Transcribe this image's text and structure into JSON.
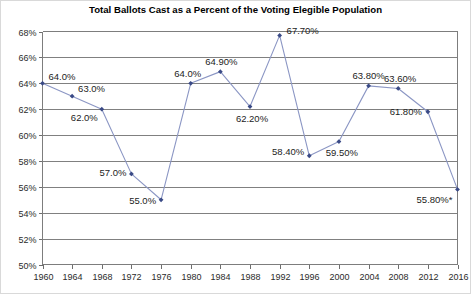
{
  "chart_data": {
    "type": "line",
    "title": "Total Ballots Cast as a Percent of the Voting Elegible Population",
    "xlabel": "",
    "ylabel": "",
    "ylim": [
      50,
      68
    ],
    "ytick_step": 2,
    "grid": true,
    "legend": "none",
    "marker": "diamond",
    "line_color": "#8b96c4",
    "marker_color": "#3a4a86",
    "categories": [
      "1960",
      "1964",
      "1968",
      "1972",
      "1976",
      "1980",
      "1984",
      "1988",
      "1992",
      "1996",
      "2000",
      "2004",
      "2008",
      "2012",
      "2016"
    ],
    "values": [
      64.0,
      63.0,
      62.0,
      57.0,
      55.0,
      64.0,
      64.9,
      62.2,
      67.7,
      58.4,
      59.5,
      63.8,
      63.6,
      61.8,
      55.8
    ],
    "point_labels": [
      "64.0%",
      "63.0%",
      "62.0%",
      "57.0%",
      "55.0%",
      "64.0%",
      "64.90%",
      "62.20%",
      "67.70%",
      "58.40%",
      "59.50%",
      "63.80%",
      "63.60%",
      "61.80%",
      "55.80%*"
    ],
    "ytick_labels": [
      "68%",
      "66%",
      "64%",
      "62%",
      "60%",
      "58%",
      "56%",
      "54%",
      "52%",
      "50%"
    ],
    "ytick_values": [
      68,
      66,
      64,
      62,
      60,
      58,
      56,
      54,
      52,
      50
    ],
    "xtick_labels": [
      "1960",
      "1964",
      "1968",
      "1972",
      "1976",
      "1980",
      "1984",
      "1988",
      "1992",
      "1996",
      "2000",
      "2004",
      "2008",
      "2012",
      "2016"
    ],
    "annotations": [
      "* asterisk on 2016 value"
    ]
  }
}
